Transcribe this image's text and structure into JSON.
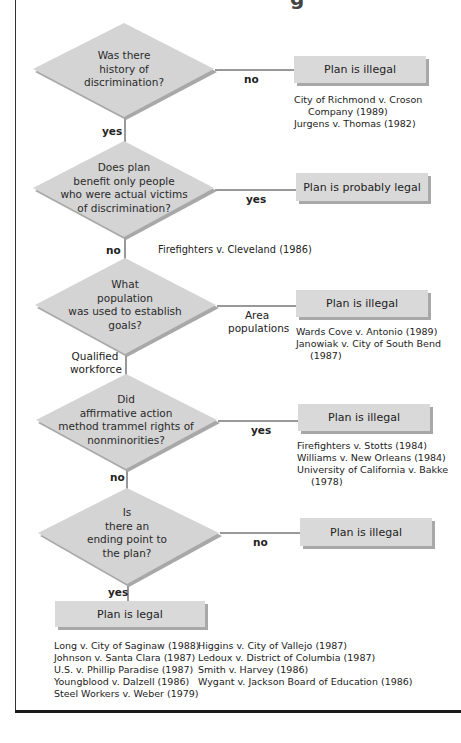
{
  "title_fragment": "g",
  "colors": {
    "diamond_fill": "#d4d4d4",
    "diamond_shadow": "#a8a8a8",
    "box_fill": "#d9d9d9",
    "box_shadow": "#a8a8a8",
    "line": "#333333"
  },
  "decisions": [
    {
      "id": "q1",
      "lines": [
        "Was there",
        "history of",
        "discrimination?"
      ],
      "branch_right": {
        "label": "no",
        "result": "Plan is illegal",
        "cases": [
          "City of Richmond v. Croson",
          "Company (1989)",
          "Jurgens v. Thomas (1982)"
        ]
      },
      "branch_down": {
        "label": "yes"
      }
    },
    {
      "id": "q2",
      "lines": [
        "Does plan",
        "benefit only people",
        "who were actual victims",
        "of discrimination?"
      ],
      "branch_right": {
        "label": "yes",
        "result": "Plan is probably  legal"
      },
      "branch_down": {
        "label": "no",
        "cases": [
          "Firefighters v. Cleveland (1986)"
        ]
      }
    },
    {
      "id": "q3",
      "lines": [
        "What",
        "population",
        "was used to establish",
        "goals?"
      ],
      "branch_right": {
        "label_lines": [
          "Area",
          "populations"
        ],
        "result": "Plan is illegal",
        "cases": [
          "Wards Cove v. Antonio (1989)",
          "Janowiak v. City of South Bend",
          "(1987)"
        ]
      },
      "branch_down": {
        "label_lines": [
          "Qualified",
          "workforce"
        ]
      }
    },
    {
      "id": "q4",
      "lines": [
        "Did",
        "affirmative action",
        "method trammel rights of",
        "nonminorities?"
      ],
      "branch_right": {
        "label": "yes",
        "result": "Plan is illegal",
        "cases": [
          "Firefighters v. Stotts (1984)",
          "Williams v. New Orleans (1984)",
          "University of California v. Bakke",
          "(1978)"
        ]
      },
      "branch_down": {
        "label": "no"
      }
    },
    {
      "id": "q5",
      "lines": [
        "Is",
        "there an",
        "ending point to",
        "the plan?"
      ],
      "branch_right": {
        "label": "no",
        "result": "Plan is illegal"
      },
      "branch_down": {
        "label": "yes"
      }
    }
  ],
  "final": {
    "result": "Plan is legal",
    "cases_left": [
      "Long v. City of Saginaw (1988)",
      "Johnson v. Santa Clara (1987)",
      "U.S. v. Phillip Paradise (1987)",
      "Youngblood v. Dalzell (1986)",
      "Steel Workers v. Weber (1979)"
    ],
    "cases_right": [
      "Higgins v. City of Vallejo (1987)",
      "Ledoux v. District of Columbia (1987)",
      "Smith v. Harvey (1986)",
      "Wygant v. Jackson Board of Education (1986)"
    ]
  }
}
